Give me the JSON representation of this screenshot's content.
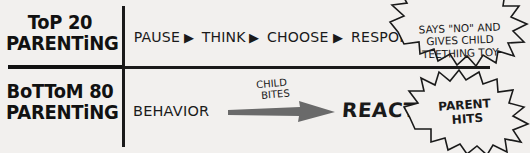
{
  "diagram": {
    "rows": [
      {
        "id": "top",
        "heading_line1": "ToP 20",
        "heading_line2": "PARENTiNG",
        "steps": [
          "PAUSE",
          "THINK",
          "CHOOSE",
          "RESPOND"
        ],
        "step_separator_icon": "right-triangle-icon",
        "callout": {
          "line1": "SAYS \"NO\" AND",
          "line2": "GIVES CHILD",
          "line3": "TEETHING TOY"
        }
      },
      {
        "id": "bottom",
        "heading_line1": "BoTToM 80",
        "heading_line2": "PARENTiNG",
        "behavior_label": "BEHAVIOR",
        "arrow_caption_line1": "CHILD",
        "arrow_caption_line2": "BITES",
        "reaction_label": "REACT",
        "callout": {
          "line1": "PARENT",
          "line2": "HITS"
        }
      }
    ],
    "colors": {
      "ink": "#1a1a1a",
      "background": "#f2f0ee",
      "arrow_gray": "#6a6a6a"
    }
  }
}
